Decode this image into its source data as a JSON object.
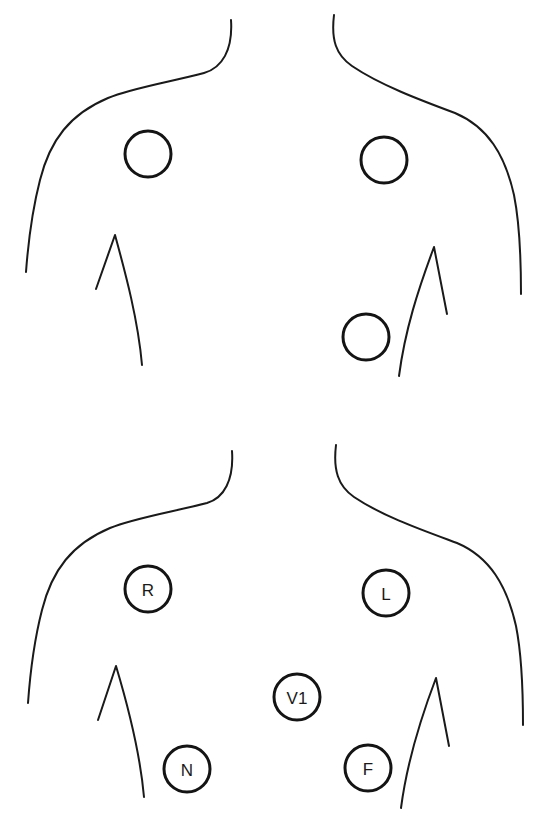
{
  "colors": {
    "background": "#ffffff",
    "line": "#1a1a1a",
    "electrode_stroke": "#141414"
  },
  "panels": [
    {
      "name": "top-panel",
      "electrodes": [
        {
          "id": "top-right-arm",
          "label": "",
          "cx": 148,
          "cy": 154,
          "r": 23
        },
        {
          "id": "top-left-arm",
          "label": "",
          "cx": 384,
          "cy": 160,
          "r": 23
        },
        {
          "id": "top-lower",
          "label": "",
          "cx": 366,
          "cy": 337,
          "r": 23
        }
      ]
    },
    {
      "name": "bottom-panel",
      "electrodes": [
        {
          "id": "R",
          "label": "R",
          "cx": 148,
          "cy": 589,
          "r": 23
        },
        {
          "id": "L",
          "label": "L",
          "cx": 386,
          "cy": 593,
          "r": 23
        },
        {
          "id": "V1",
          "label": "V1",
          "cx": 297,
          "cy": 697,
          "r": 23
        },
        {
          "id": "N",
          "label": "N",
          "cx": 187,
          "cy": 769,
          "r": 23
        },
        {
          "id": "F",
          "label": "F",
          "cx": 368,
          "cy": 768,
          "r": 23
        }
      ]
    }
  ]
}
